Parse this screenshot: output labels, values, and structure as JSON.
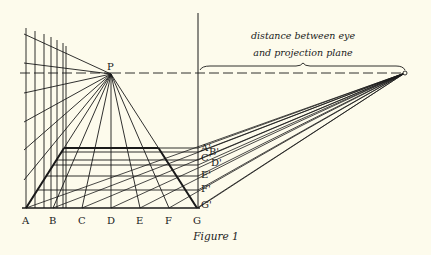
{
  "figure": {
    "caption": "Figure 1",
    "annotation_line1": "distance between eye",
    "annotation_line2": "and projection plane",
    "vanishing_point_label": "P",
    "base_labels": [
      "A",
      "B",
      "C",
      "D",
      "E",
      "F",
      "G"
    ],
    "plane_labels": [
      "A'",
      "B'",
      "C'",
      "D'",
      "E'",
      "F'",
      "G'"
    ],
    "colors": {
      "background": "#fdfbec",
      "ink": "#1a1a1a"
    }
  }
}
